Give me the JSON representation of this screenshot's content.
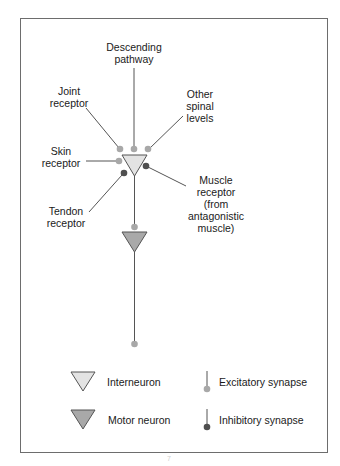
{
  "colors": {
    "frame": "#6d6d6d",
    "line": "#555555",
    "interneuron_fill": "#e3e3e3",
    "motor_neuron_fill": "#a9a9a9",
    "excitatory": "#a8a8a8",
    "inhibitory": "#4f4f4f"
  },
  "labels": {
    "descending": "Descending\npathway",
    "joint": "Joint\nreceptor",
    "other_spinal": "Other\nspinal\nlevels",
    "skin": "Skin\nreceptor",
    "muscle": "Muscle\nreceptor\n(from\nantagonistic\nmuscle)",
    "tendon": "Tendon\nreceptor"
  },
  "legend": {
    "interneuron": "Interneuron",
    "motor_neuron": "Motor neuron",
    "excitatory": "Excitatory synapse",
    "inhibitory": "Inhibitory synapse"
  },
  "inputs": [
    {
      "name": "descending-pathway",
      "type": "excitatory"
    },
    {
      "name": "joint-receptor",
      "type": "excitatory"
    },
    {
      "name": "other-spinal-levels",
      "type": "excitatory"
    },
    {
      "name": "skin-receptor",
      "type": "excitatory"
    },
    {
      "name": "tendon-receptor",
      "type": "inhibitory"
    },
    {
      "name": "muscle-receptor",
      "type": "inhibitory"
    }
  ],
  "page_number": "7"
}
